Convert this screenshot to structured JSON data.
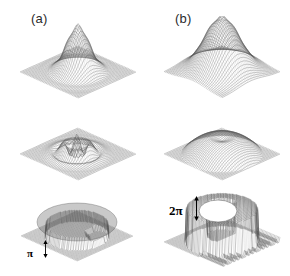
{
  "figure": {
    "background_color": "#ffffff",
    "ink_color": "#555555",
    "width": 290,
    "height": 276,
    "columns": [
      {
        "id": "a",
        "label": "(a)"
      },
      {
        "id": "b",
        "label": "(b)"
      }
    ],
    "row_count": 3,
    "annotations": [
      {
        "id": "pi",
        "text": "π",
        "panel": "a-row3",
        "kind": "height-scale-bar"
      },
      {
        "id": "two-pi",
        "text": "2π",
        "panel": "b-row3",
        "kind": "height-scale-bar"
      }
    ]
  },
  "chart_data": {
    "type": "surface",
    "title": "",
    "subtitle": "",
    "xlabel": "",
    "ylabel": "",
    "legend": [],
    "grid": true,
    "projection": "isometric-wireframe-mesh",
    "colormap": "grayscale",
    "panels": [
      {
        "id": "a-row1",
        "column": "a",
        "row": 1,
        "label": "(a)",
        "description": "narrow sharp single peak on flat mesh plane",
        "mesh_lines": 40,
        "peak_height": 1.0,
        "peak_width": 0.14,
        "baseline": 0.0,
        "ripple_amplitude": 0.05,
        "center": [
          0.5,
          0.5
        ]
      },
      {
        "id": "b-row1",
        "column": "b",
        "row": 1,
        "label": "(b)",
        "description": "broad rounded tall single peak on flat mesh plane",
        "mesh_lines": 40,
        "peak_height": 1.1,
        "peak_width": 0.22,
        "baseline": 0.0,
        "ripple_amplitude": 0.04,
        "center": [
          0.5,
          0.5
        ]
      },
      {
        "id": "a-row2",
        "column": "a",
        "row": 2,
        "label": "",
        "description": "low rippled twin-peak structure on flat mesh plane",
        "mesh_lines": 40,
        "peak_height": 0.36,
        "peak_width": 0.18,
        "baseline": 0.0,
        "ripple_amplitude": 0.09,
        "center": [
          0.48,
          0.5
        ]
      },
      {
        "id": "b-row2",
        "column": "b",
        "row": 2,
        "label": "",
        "description": "flat-topped crater / volcano shaped plateau on mesh plane",
        "mesh_lines": 40,
        "peak_height": 0.4,
        "peak_width": 0.26,
        "baseline": 0.0,
        "ripple_amplitude": 0.03,
        "crater_depth": 0.12,
        "center": [
          0.5,
          0.5
        ]
      },
      {
        "id": "a-row3",
        "column": "a",
        "row": 3,
        "label": "",
        "description": "flat circular disc plateau with phase-wrap step at rim",
        "mesh_lines": 44,
        "plateau_height": 0.3,
        "disc_radius": 0.4,
        "wrap_step": "π",
        "shading": "mid-gray"
      },
      {
        "id": "b-row3",
        "column": "b",
        "row": 3,
        "label": "",
        "description": "tall raised dome with deep white crater and striped fringe bands at front",
        "mesh_lines": 44,
        "plateau_height": 0.78,
        "disc_radius": 0.44,
        "wrap_step": "2π",
        "shading": "mid-gray",
        "fringe_bands": 16
      }
    ]
  }
}
